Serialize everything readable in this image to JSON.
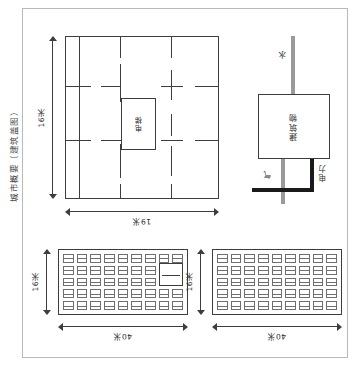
{
  "figure": {
    "caption": "城市概要（建筑盖图）"
  },
  "floor_plan": {
    "name": "建筑盖图",
    "elevator_label": "电梯",
    "width_label": "19米",
    "height_label": "16米",
    "width_value": 19,
    "height_value": 16,
    "unit": "米"
  },
  "utility_schematic": {
    "building_label": "建筑物",
    "water_label": "水",
    "gas_label": "气",
    "power_label": "电力"
  },
  "office_plan_left": {
    "width_label": "40米",
    "height_label": "16米",
    "desk_columns": 9,
    "desk_rows": 5,
    "has_corner_room": true
  },
  "office_plan_right": {
    "width_label": "40米",
    "height_label": "16米",
    "desk_columns": 9,
    "desk_rows": 5,
    "has_corner_room": false
  },
  "colors": {
    "line": "#3d3d3d",
    "frame": "#b9b9b9",
    "pipe_gray": "#9a9a9a",
    "pipe_dark": "#1a1a1a",
    "background": "#ffffff"
  }
}
